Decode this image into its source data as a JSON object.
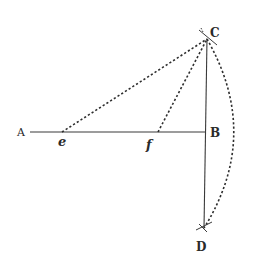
{
  "diagram": {
    "type": "geometric-construction",
    "style": "engraved line drawing",
    "colors": {
      "ink": "#2e2e2e",
      "background": "#ffffff"
    },
    "points": {
      "A": {
        "label": "A",
        "x": 30,
        "y": 132
      },
      "e": {
        "label": "e",
        "x": 62,
        "y": 132
      },
      "f": {
        "label": "f",
        "x": 158,
        "y": 132
      },
      "B": {
        "label": "B",
        "x": 206,
        "y": 132
      },
      "C": {
        "label": "C",
        "x": 207,
        "y": 39
      },
      "D": {
        "label": "D",
        "x": 203,
        "y": 228
      }
    },
    "segments": [
      {
        "name": "line-AB",
        "from": "A",
        "to": "B",
        "style": "solid"
      },
      {
        "name": "line-CD",
        "from": "C",
        "to": "D",
        "style": "solid"
      },
      {
        "name": "line-eC",
        "from": "e",
        "to": "C",
        "style": "dotted"
      },
      {
        "name": "line-fC",
        "from": "f",
        "to": "C",
        "style": "dotted"
      }
    ],
    "arcs": [
      {
        "name": "arc-CD",
        "from": "C",
        "to": "D",
        "style": "dotted",
        "bulge": "right"
      }
    ],
    "labels": {
      "A": "A",
      "e": "e",
      "f": "f",
      "B": "B",
      "C": "C",
      "D": "D"
    }
  }
}
